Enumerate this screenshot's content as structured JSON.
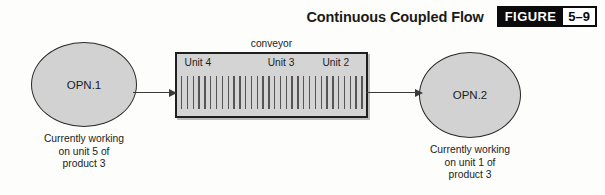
{
  "figure": {
    "title": "Continuous Coupled Flow",
    "badge_label": "FIGURE",
    "badge_number": "5–9"
  },
  "colors": {
    "page_background": "#fdfdfb",
    "node_fill": "#d2d2d2",
    "node_stroke": "#2a2a2a",
    "conveyor_fill": "#d4d4d4",
    "conveyor_stroke": "#1f1f1f",
    "tick": "#555555",
    "arrow": "#3a3a3a",
    "badge_background": "#0b0b0b",
    "badge_number_background": "#ffffff",
    "text": "#1c1c1c"
  },
  "nodes": [
    {
      "id": "opn1",
      "label": "OPN.1",
      "caption": "Currently working\non unit 5 of\nproduct 3"
    },
    {
      "id": "opn2",
      "label": "OPN.2",
      "caption": "Currently working\non unit 1 of\nproduct 3"
    }
  ],
  "conveyor": {
    "caption": "conveyor",
    "tick_count": 32,
    "units": [
      {
        "label": "Unit 4",
        "left_pct": 4
      },
      {
        "label": "Unit 3",
        "left_pct": 48
      },
      {
        "label": "Unit 2",
        "left_pct": 77
      }
    ]
  },
  "arrows": [
    {
      "id": "arrow-in",
      "from": "opn1",
      "to": "conveyor"
    },
    {
      "id": "arrow-out",
      "from": "conveyor",
      "to": "opn2"
    }
  ]
}
